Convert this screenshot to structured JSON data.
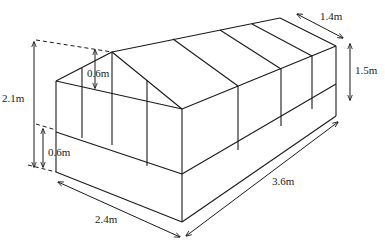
{
  "diagram": {
    "labels": {
      "total_height": "2.1m",
      "roof_rise": "0.6m",
      "base_height": "0.6m",
      "side_wall_height": "1.5m",
      "half_depth": "1.4m",
      "width": "2.4m",
      "length": "3.6m"
    },
    "colors": {
      "line": "#1a1a1a",
      "background": "#ffffff"
    }
  }
}
